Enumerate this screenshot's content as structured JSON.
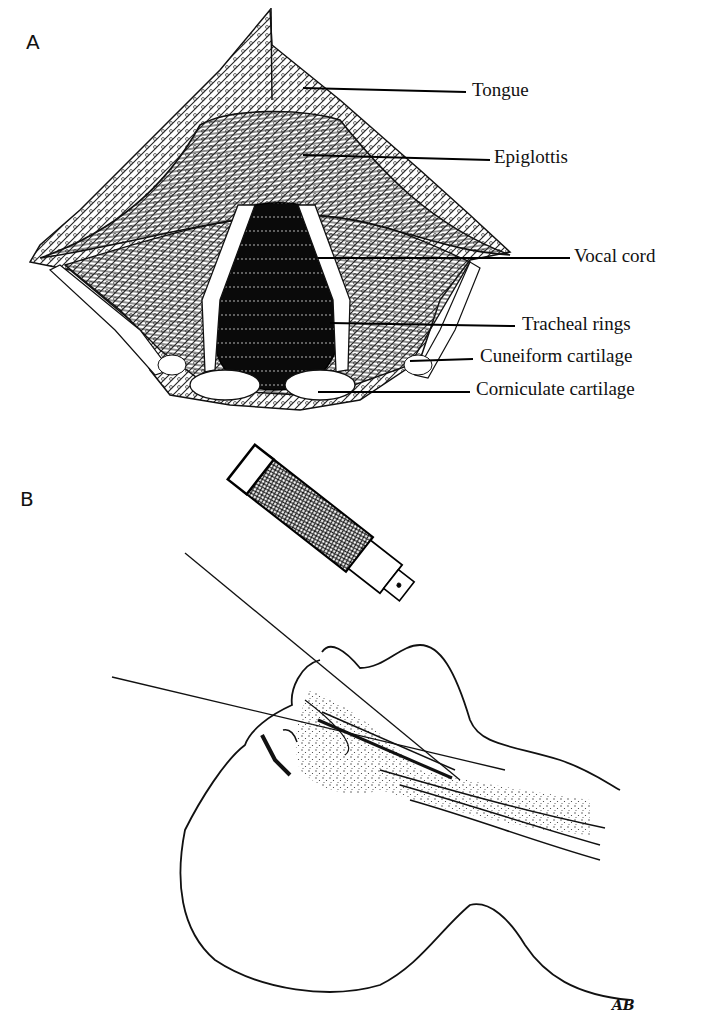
{
  "figure": {
    "panel_a": {
      "letter": "A",
      "subject": "laryngoscopic view of larynx",
      "labels": [
        {
          "id": "tongue",
          "text": "Tongue"
        },
        {
          "id": "epiglottis",
          "text": "Epiglottis"
        },
        {
          "id": "vocal_cord",
          "text": "Vocal cord"
        },
        {
          "id": "tracheal_rings",
          "text": "Tracheal rings"
        },
        {
          "id": "cuneiform_cartilage",
          "text": "Cuneiform cartilage"
        },
        {
          "id": "corniculate_cartilage",
          "text": "Corniculate cartilage"
        }
      ]
    },
    "panel_b": {
      "letter": "B",
      "subject": "laryngoscope inserted in patient profile with sight lines",
      "signature": "AB"
    }
  }
}
